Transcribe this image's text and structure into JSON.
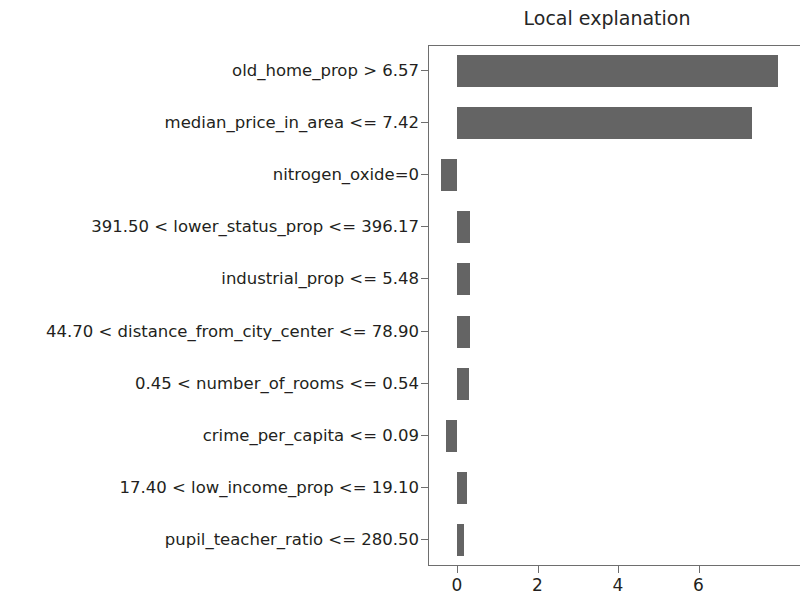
{
  "chart_data": {
    "type": "bar",
    "title": "Local explanation",
    "orientation": "horizontal",
    "xlabel": "",
    "ylabel": "",
    "xlim": [
      -0.72,
      8.52
    ],
    "xticks": [
      0,
      2,
      4,
      6
    ],
    "xtick_labels": [
      "0",
      "2",
      "4",
      "6"
    ],
    "grid": false,
    "legend": null,
    "bar_color": "#646464",
    "categories": [
      "old_home_prop > 6.57",
      "median_price_in_area <= 7.42",
      "nitrogen_oxide=0",
      "391.50 < lower_status_prop <= 396.17",
      "industrial_prop <= 5.48",
      "44.70 < distance_from_city_center <= 78.90",
      "0.45 < number_of_rooms <= 0.54",
      "crime_per_capita <= 0.09",
      "17.40 < low_income_prop <= 19.10",
      "pupil_teacher_ratio <= 280.50"
    ],
    "values": [
      7.98,
      7.33,
      -0.4,
      0.33,
      0.32,
      0.33,
      0.31,
      -0.28,
      0.26,
      0.18
    ]
  },
  "figure": {
    "title": "Local explanation"
  }
}
